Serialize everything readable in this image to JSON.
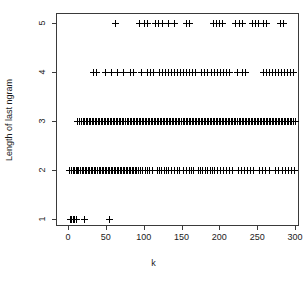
{
  "chart_data": {
    "type": "scatter",
    "title": "",
    "xlabel": "k",
    "ylabel": "Length of last ngram",
    "xlim": [
      -8,
      313
    ],
    "ylim": [
      0.6,
      5.4
    ],
    "grid": false,
    "legend": null,
    "marker": "plus",
    "marker_color": "#000000",
    "xticks": [
      0,
      50,
      100,
      150,
      200,
      250,
      300
    ],
    "xtick_labels": [
      "0",
      "50",
      "100",
      "150",
      "200",
      "250",
      "300"
    ],
    "yticks": [
      1,
      2,
      3,
      4,
      5
    ],
    "ytick_labels": [
      "1",
      "2",
      "3",
      "4",
      "5"
    ],
    "series": [
      {
        "name": "last ngram length",
        "points_by_y": {
          "1": [
            3,
            5,
            7,
            9,
            11,
            22,
            55
          ],
          "2": [
            2,
            5,
            7,
            9,
            11,
            13,
            14,
            16,
            17,
            19,
            21,
            23,
            25,
            27,
            29,
            31,
            33,
            35,
            37,
            39,
            41,
            43,
            45,
            47,
            49,
            51,
            53,
            55,
            57,
            59,
            61,
            63,
            65,
            67,
            69,
            71,
            73,
            75,
            77,
            79,
            81,
            83,
            85,
            87,
            89,
            91,
            93,
            96,
            99,
            102,
            105,
            108,
            112,
            118,
            121,
            124,
            127,
            130,
            133,
            137,
            141,
            145,
            148,
            152,
            156,
            160,
            163,
            166,
            172,
            175,
            178,
            182,
            185,
            188,
            191,
            194,
            198,
            202,
            206,
            210,
            214,
            218,
            225,
            229,
            233,
            237,
            241,
            245,
            253,
            257,
            261,
            266,
            274,
            278,
            283,
            287,
            291,
            295,
            299
          ],
          "3": [
            12,
            15,
            18,
            20,
            22,
            24,
            26,
            28,
            30,
            32,
            34,
            36,
            38,
            40,
            42,
            44,
            46,
            48,
            50,
            52,
            54,
            56,
            58,
            60,
            62,
            64,
            66,
            68,
            70,
            72,
            74,
            76,
            78,
            80,
            82,
            84,
            86,
            88,
            90,
            92,
            94,
            96,
            98,
            100,
            102,
            104,
            106,
            108,
            110,
            112,
            114,
            116,
            118,
            120,
            122,
            124,
            126,
            128,
            130,
            132,
            134,
            136,
            138,
            140,
            142,
            144,
            146,
            148,
            150,
            152,
            154,
            156,
            158,
            160,
            162,
            164,
            166,
            168,
            170,
            172,
            174,
            176,
            178,
            180,
            182,
            184,
            186,
            188,
            190,
            192,
            194,
            196,
            198,
            200,
            202,
            204,
            206,
            208,
            210,
            212,
            214,
            216,
            218,
            220,
            222,
            224,
            226,
            228,
            230,
            232,
            234,
            236,
            238,
            240,
            242,
            244,
            246,
            248,
            250,
            252,
            254,
            256,
            258,
            260,
            262,
            264,
            266,
            268,
            270,
            272,
            274,
            276,
            278,
            280,
            282,
            284,
            286,
            288,
            290,
            292,
            294,
            296,
            298,
            300
          ],
          "4": [
            34,
            38,
            50,
            58,
            66,
            74,
            82,
            86,
            97,
            105,
            109,
            113,
            121,
            125,
            129,
            133,
            137,
            141,
            145,
            149,
            153,
            157,
            161,
            165,
            169,
            177,
            181,
            185,
            189,
            193,
            197,
            201,
            205,
            209,
            213,
            224,
            230,
            234,
            258,
            262,
            266,
            270,
            274,
            278,
            282,
            286,
            290,
            294,
            298
          ],
          "5": [
            63,
            95,
            101,
            105,
            115,
            120,
            125,
            133,
            141,
            156,
            160,
            192,
            196,
            200,
            204,
            222,
            226,
            230,
            244,
            248,
            252,
            258,
            262,
            281,
            285
          ]
        }
      }
    ]
  },
  "axes": {
    "x_title": "k",
    "y_title": "Length of last ngram"
  }
}
